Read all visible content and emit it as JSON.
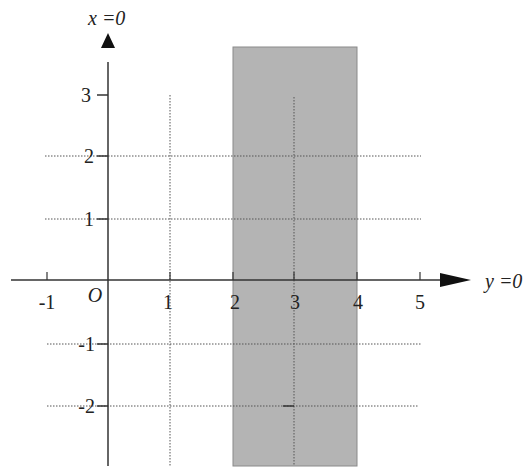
{
  "diagram": {
    "type": "coordinate-plane",
    "origin_label": "O",
    "vertical_axis_label": "x =0",
    "horizontal_axis_label": "y =0",
    "horizontal_ticks": [
      {
        "value": -1,
        "label": "-1"
      },
      {
        "value": 1,
        "label": "1"
      },
      {
        "value": 2,
        "label": "2"
      },
      {
        "value": 3,
        "label": "3"
      },
      {
        "value": 4,
        "label": "4"
      },
      {
        "value": 5,
        "label": "5"
      }
    ],
    "vertical_ticks": [
      {
        "value": 3,
        "label": "3"
      },
      {
        "value": 2,
        "label": "2"
      },
      {
        "value": 1,
        "label": "1"
      },
      {
        "value": -1,
        "label": "-1"
      },
      {
        "value": -2,
        "label": "-2"
      }
    ],
    "shaded_region": {
      "description": "vertical strip between 2 and 4 on the horizontal axis",
      "from": 2,
      "to": 4,
      "color": "#b4b4b4"
    },
    "dotted_gridlines": {
      "horizontal_at": [
        2,
        1,
        -1,
        -2
      ],
      "vertical_at": [
        1,
        3
      ]
    },
    "colors": {
      "axis": "#333333",
      "grid": "#555555",
      "shade": "#b4b4b4",
      "background": "#ffffff"
    }
  }
}
